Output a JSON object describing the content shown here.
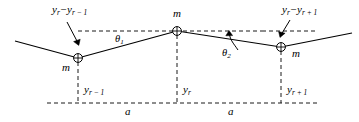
{
  "figure": {
    "name": "transverse-wave-mass-chain-diagram",
    "colors": {
      "line": "#000000",
      "dashed": "#000000",
      "background": "#ffffff",
      "text": "#000000"
    }
  },
  "labels": {
    "displacement_left": {
      "full": "yr − yr−1",
      "base": "y",
      "sub1": "r",
      "operator": "−",
      "base2": "y",
      "sub2": "r − 1"
    },
    "displacement_right": {
      "full": "yr − yr+1",
      "base": "y",
      "sub1": "r",
      "operator": "−",
      "base2": "y",
      "sub2": "r + 1"
    },
    "mass_left": "m",
    "mass_center": "m",
    "mass_right": "m",
    "theta_one": {
      "symbol": "θ",
      "subscript": "1"
    },
    "theta_two": {
      "symbol": "θ",
      "subscript": "2"
    },
    "ordinate_left": {
      "base": "y",
      "subscript": "r − 1"
    },
    "ordinate_center": {
      "base": "y",
      "subscript": "r"
    },
    "ordinate_right": {
      "base": "y",
      "subscript": "r + 1"
    },
    "spacing_left": "a",
    "spacing_right": "a"
  },
  "geometry": {
    "nodes": [
      {
        "name": "mass-r-minus-1",
        "x": 78,
        "y": 58
      },
      {
        "name": "mass-r",
        "x": 177,
        "y": 31
      },
      {
        "name": "mass-r-plus-1",
        "x": 281,
        "y": 47
      }
    ],
    "string_left_end": {
      "x": 15,
      "y": 41
    },
    "string_right_end": {
      "x": 352,
      "y": 33
    },
    "baseline_y": 103,
    "baseline_x_start": 47,
    "baseline_x_end": 318,
    "dashed_horizontal_left": {
      "x1": 78,
      "x2": 262,
      "y": 31
    },
    "dashed_horizontal_right": {
      "x1": 177,
      "x2": 318,
      "y": 31
    }
  }
}
